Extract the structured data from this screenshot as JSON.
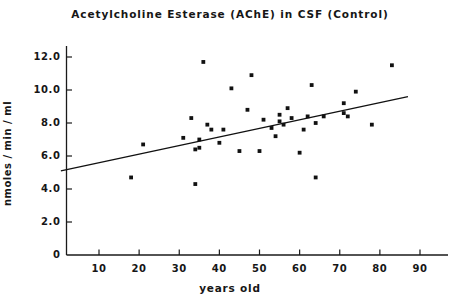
{
  "chart_data": {
    "type": "scatter",
    "title": "Acetylcholine Esterase (AChE) in CSF (Control)",
    "xlabel": "years old",
    "ylabel": "nmoles / min / ml",
    "xlim": [
      0,
      95
    ],
    "ylim": [
      0,
      12.8
    ],
    "grid": false,
    "legend": "none",
    "xticks": [
      10,
      20,
      30,
      40,
      50,
      60,
      70,
      80,
      90
    ],
    "xtick_labels": [
      "10",
      "20",
      "30",
      "40",
      "50",
      "60",
      "70",
      "80",
      "90"
    ],
    "yticks": [
      0,
      2.0,
      4.0,
      6.0,
      8.0,
      10.0,
      12.0
    ],
    "ytick_labels": [
      "0",
      "2.0",
      "4.0",
      "6.0",
      "8.0",
      "10.0",
      "12.0"
    ],
    "series": [
      {
        "name": "AChE activity",
        "marker": "square-dot",
        "marker_color": "#111111",
        "x": [
          18,
          21,
          31,
          33,
          34,
          34,
          35,
          35,
          36,
          37,
          38,
          40,
          41,
          43,
          45,
          47,
          48,
          50,
          51,
          53,
          54,
          55,
          55,
          56,
          57,
          58,
          60,
          61,
          62,
          63,
          64,
          64,
          66,
          71,
          71,
          72,
          74,
          78,
          83
        ],
        "y": [
          4.7,
          6.7,
          7.1,
          8.3,
          6.4,
          4.3,
          7.0,
          6.5,
          11.7,
          7.9,
          7.6,
          6.8,
          7.6,
          10.1,
          6.3,
          8.8,
          10.9,
          6.3,
          8.2,
          7.7,
          7.2,
          8.5,
          8.1,
          7.9,
          8.9,
          8.3,
          6.2,
          7.6,
          8.4,
          10.3,
          4.7,
          8.0,
          8.4,
          9.2,
          8.6,
          8.4,
          9.9,
          7.9,
          11.5
        ]
      }
    ],
    "trend_line": {
      "name": "regression line",
      "color": "#111111",
      "x_start": 0.5,
      "y_start": 5.1,
      "x_end": 87,
      "y_end": 9.6
    }
  }
}
